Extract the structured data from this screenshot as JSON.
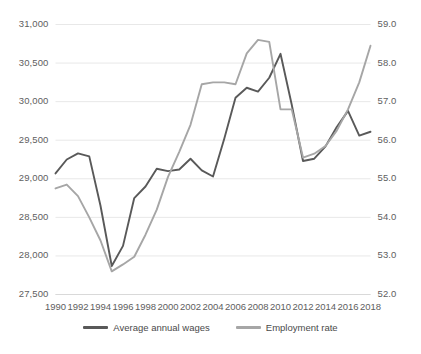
{
  "chart_data": {
    "type": "line",
    "title": "",
    "xlabel": "",
    "ylabel": "",
    "grid": true,
    "legend_position": "bottom",
    "x": [
      1990,
      1991,
      1992,
      1993,
      1994,
      1995,
      1996,
      1997,
      1998,
      1999,
      2000,
      2001,
      2002,
      2003,
      2004,
      2005,
      2006,
      2007,
      2008,
      2009,
      2010,
      2011,
      2012,
      2013,
      2014,
      2015,
      2016,
      2017,
      2018
    ],
    "xtick_labels": [
      "1990",
      "1992",
      "1994",
      "1996",
      "1998",
      "2000",
      "2002",
      "2004",
      "2006",
      "2008",
      "2010",
      "2012",
      "2014",
      "2016",
      "2018"
    ],
    "axes": [
      {
        "id": "left",
        "name": "Average annual wages",
        "ylim": [
          27500,
          31000
        ],
        "ytick_labels": [
          "31,000",
          "30,500",
          "30,000",
          "29,500",
          "29,000",
          "28,500",
          "28,000",
          "27,500"
        ],
        "ytick_values": [
          31000,
          30500,
          30000,
          29500,
          29000,
          28500,
          28000,
          27500
        ]
      },
      {
        "id": "right",
        "name": "Employment rate",
        "ylim": [
          52.0,
          59.0
        ],
        "ytick_labels": [
          "59.0",
          "58.0",
          "57.0",
          "56.0",
          "55.0",
          "54.0",
          "53.0",
          "52.0"
        ],
        "ytick_values": [
          59.0,
          58.0,
          57.0,
          56.0,
          55.0,
          54.0,
          53.0,
          52.0
        ]
      }
    ],
    "series": [
      {
        "name": "Average annual wages",
        "axis": "left",
        "color": "#595959",
        "values": [
          29070,
          29250,
          29330,
          29290,
          28650,
          27870,
          28130,
          28750,
          28900,
          29130,
          29100,
          29120,
          29260,
          29110,
          29030,
          29520,
          30050,
          30180,
          30130,
          30310,
          30620,
          29960,
          29230,
          29260,
          29420,
          29670,
          29880,
          29560,
          29610
        ]
      },
      {
        "name": "Employment rate",
        "axis": "right",
        "color": "#a6a6a6",
        "values": [
          54.75,
          54.85,
          54.55,
          54.0,
          53.4,
          52.6,
          52.78,
          52.98,
          53.55,
          54.2,
          55.05,
          55.7,
          56.4,
          57.45,
          57.5,
          57.5,
          57.45,
          58.25,
          58.6,
          58.55,
          56.8,
          56.8,
          55.55,
          55.65,
          55.85,
          56.25,
          56.8,
          57.5,
          58.45
        ]
      }
    ]
  },
  "legend": {
    "items": [
      {
        "label": "Average annual wages",
        "color": "#595959"
      },
      {
        "label": "Employment rate",
        "color": "#a6a6a6"
      }
    ]
  }
}
